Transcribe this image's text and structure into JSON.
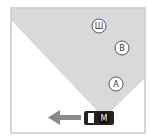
{
  "diagram": {
    "frame": {
      "x": 11,
      "y": 8,
      "w": 134,
      "h": 125,
      "stroke": "#c8c8c8"
    },
    "cone": {
      "color": "#d9d9d9",
      "points": "11,8 145,8 145,78 104,118 11,20"
    },
    "points": [
      {
        "id": "sha",
        "label": "Ш",
        "cx": 99,
        "cy": 26
      },
      {
        "id": "b",
        "label": "B",
        "cx": 122,
        "cy": 48
      },
      {
        "id": "a",
        "label": "A",
        "cx": 116,
        "cy": 84
      }
    ],
    "car": {
      "label": "M",
      "x": 84,
      "y": 111,
      "w": 30,
      "h": 14
    },
    "arrow": {
      "direction": "left",
      "color": "#8a8a8a"
    }
  }
}
